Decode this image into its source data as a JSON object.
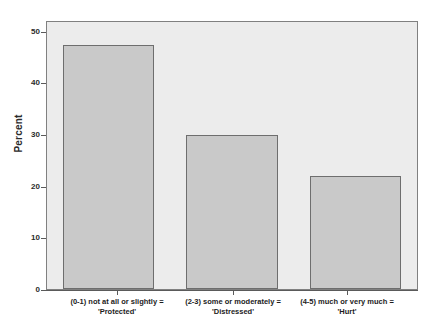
{
  "chart_data": {
    "type": "bar",
    "title": "",
    "xlabel": "",
    "ylabel": "Percent",
    "ylim": [
      0,
      52
    ],
    "yticks": [
      0,
      10,
      20,
      30,
      40,
      50
    ],
    "ytick_labels": [
      "0",
      "10",
      "20",
      "30",
      "40",
      "50"
    ],
    "grid": false,
    "legend": "none",
    "categories": [
      "(0-1) not at all or slightly = 'Protected'",
      "(2-3) some or moderately = 'Distressed'",
      "(4-5) much or very much = 'Hurt'"
    ],
    "category_lines": [
      {
        "line1": "(0-1) not at all or slightly =",
        "line2": "'Protected'"
      },
      {
        "line1": "(2-3) some or moderately =",
        "line2": "'Distressed'"
      },
      {
        "line1": "(4-5) much or very much =",
        "line2": "'Hurt'"
      }
    ],
    "values": [
      47.5,
      30.0,
      22.0
    ],
    "bar_color": "#c9c9c9",
    "bar_edge_color": "#6e6e6e",
    "plot_background": "#ececec",
    "axis_color": "#5a5a5a"
  }
}
